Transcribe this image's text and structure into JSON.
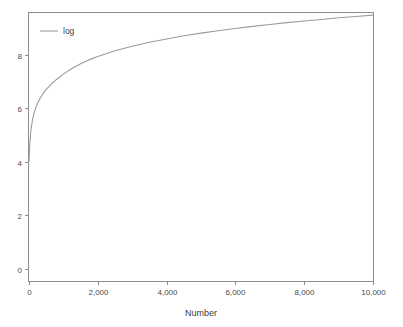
{
  "chart_data": {
    "type": "line",
    "title": "",
    "xlabel": "Number",
    "ylabel": "",
    "xlim": [
      0,
      10000
    ],
    "ylim": [
      -0.45,
      9.55
    ],
    "grid": false,
    "legend_position": "top-left",
    "xticks": [
      0,
      2000,
      4000,
      6000,
      8000,
      10000
    ],
    "xtick_labels": [
      "0",
      "2,000",
      "4,000",
      "6,000",
      "8,000",
      "10,000"
    ],
    "yticks": [
      0,
      2,
      4,
      6,
      8
    ],
    "ytick_labels": [
      "0",
      "2",
      "4",
      "6",
      "8"
    ],
    "series": [
      {
        "name": "log",
        "color": "#9b9b9b",
        "x": [
          1,
          10,
          25,
          50,
          75,
          100,
          150,
          200,
          300,
          400,
          500,
          650,
          800,
          1000,
          1250,
          1500,
          1750,
          2000,
          2500,
          3000,
          3500,
          4000,
          4500,
          5000,
          5500,
          6000,
          6500,
          7000,
          7500,
          8000,
          8500,
          9000,
          9500,
          10000
        ],
        "y": [
          4.0,
          4.3,
          4.7,
          5.1,
          5.35,
          5.55,
          5.83,
          6.03,
          6.32,
          6.53,
          6.7,
          6.9,
          7.07,
          7.27,
          7.48,
          7.66,
          7.81,
          7.93,
          8.14,
          8.31,
          8.46,
          8.58,
          8.7,
          8.8,
          8.89,
          8.97,
          9.05,
          9.12,
          9.19,
          9.25,
          9.31,
          9.37,
          9.42,
          9.47
        ]
      }
    ]
  },
  "legend": {
    "entries": [
      {
        "label": "log"
      }
    ]
  },
  "axes": {
    "x_title": "Number",
    "y_title": ""
  },
  "colors": {
    "series": "#9b9b9b",
    "frame": "#8d8d8d",
    "text": "#3c3c3c",
    "background": "#ffffff"
  }
}
